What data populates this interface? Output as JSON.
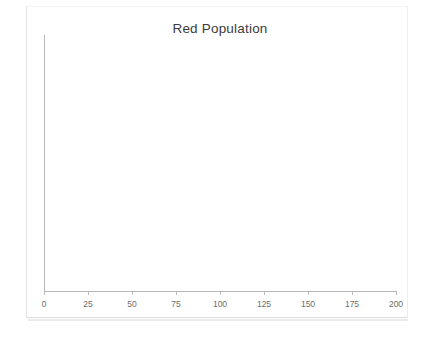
{
  "chart_data": {
    "type": "line",
    "title": "Red Population",
    "xlabel": "",
    "ylabel": "",
    "xlim": [
      0,
      200
    ],
    "xticks": [
      0,
      25,
      50,
      75,
      100,
      125,
      150,
      175,
      200
    ],
    "xtick_labels": [
      "0",
      "25",
      "50",
      "75",
      "100",
      "125",
      "150",
      "175",
      "200"
    ],
    "yticks": [],
    "ytick_labels": [],
    "grid": false,
    "legend": null,
    "series": [
      {
        "name": "Red Population",
        "x": [],
        "values": []
      }
    ],
    "annotations": [],
    "note": "Plot area is empty - no data points are rendered in the figure"
  },
  "figure": {
    "title": "Red Population",
    "axis_color": "#b6b6b6",
    "title_color": "#3b3b3b",
    "tick_label_color": "#6d6d6d",
    "background": "#ffffff"
  }
}
